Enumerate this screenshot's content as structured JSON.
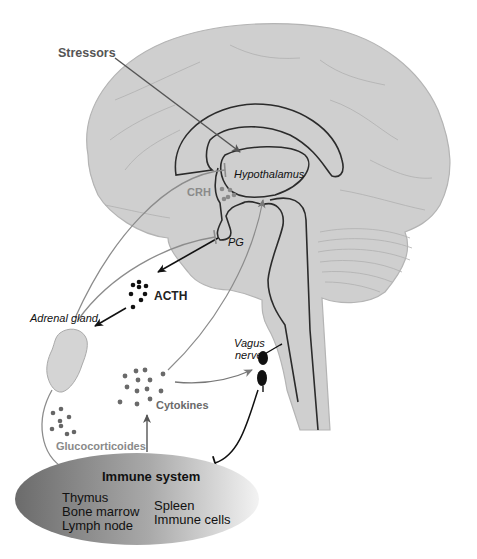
{
  "figure": {
    "labels": {
      "stressors": "Stressors",
      "hypothalamus": "Hypothalamus",
      "crh": "CRH",
      "pg": "PG",
      "acth": "ACTH",
      "adrenal_gland": "Adrenal gland",
      "vagus_nerve_line1": "Vagus",
      "vagus_nerve_line2": "nerve",
      "cytokines": "Cytokines",
      "glucocorticoides": "Glucocorticoides"
    },
    "immune_system": {
      "title": "Immune system",
      "left_items": [
        "Thymus",
        "Bone marrow",
        "Lymph node"
      ],
      "right_items": [
        "Spleen",
        "Immune cells"
      ]
    },
    "connections": [
      {
        "from": "Stressors",
        "to": "Hypothalamus",
        "type": "stimulate"
      },
      {
        "from": "PG",
        "to": "ACTH",
        "type": "stimulate"
      },
      {
        "from": "ACTH",
        "to": "Adrenal gland",
        "type": "stimulate"
      },
      {
        "from": "Adrenal gland",
        "to": "Hypothalamus",
        "type": "inhibit"
      },
      {
        "from": "Adrenal gland",
        "to": "PG",
        "type": "inhibit"
      },
      {
        "from": "Glucocorticoides",
        "to": "Immune system",
        "type": "inhibit"
      },
      {
        "from": "Immune system",
        "to": "Cytokines",
        "type": "stimulate"
      },
      {
        "from": "Cytokines",
        "to": "Hypothalamus",
        "type": "stimulate"
      },
      {
        "from": "Cytokines",
        "to": "Vagus nerve",
        "type": "stimulate"
      },
      {
        "from": "Vagus nerve",
        "to": "Immune system",
        "type": "inhibit"
      }
    ],
    "colors": {
      "brain_fill": "#cfcfcf",
      "brain_outline": "#a8a8a8",
      "structure_line": "#2b2b2b",
      "gray_arrow": "#8c8c8c",
      "black_arrow": "#111111",
      "acth_dot": "#111111",
      "cytokine_dot": "#6a6a6a",
      "gluco_dot": "#666666",
      "adrenal_fill": "#d4d4d4",
      "immune_dark": "#6e6e6e",
      "immune_light": "#f2f2f2"
    }
  }
}
